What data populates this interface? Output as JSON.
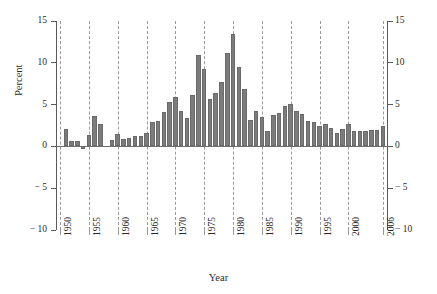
{
  "chart_data": {
    "type": "bar",
    "title": "",
    "subtitle": "",
    "xlabel": "Year",
    "ylabel": "Percent",
    "xlim": [
      1949.3,
      2006.7
    ],
    "ylim": [
      -10,
      15
    ],
    "yticks": [
      15,
      10,
      5,
      0,
      -5,
      -10
    ],
    "ytick_labels": [
      "15",
      "10",
      "5",
      "0",
      "− 5",
      "− 10"
    ],
    "xticks": [
      1950,
      1955,
      1960,
      1965,
      1970,
      1975,
      1980,
      1985,
      1990,
      1995,
      2000,
      2006
    ],
    "xtick_labels": [
      "1950",
      "1955",
      "1960",
      "1965",
      "1970",
      "1975",
      "1980",
      "1985",
      "1990",
      "1995",
      "2000",
      "2006"
    ],
    "grid": "vertical-dashed-at-xticks",
    "legend": "none",
    "bar_color": "#7c7c7c",
    "bar_edge_color": "#6a6a6a",
    "axis_color": "#5a5a5a",
    "grid_color": "#9a9a9a",
    "right_axis_mirrors_left": true,
    "categories": [
      1950,
      1951,
      1952,
      1953,
      1954,
      1955,
      1956,
      1957,
      1958,
      1959,
      1960,
      1961,
      1962,
      1963,
      1964,
      1965,
      1966,
      1967,
      1968,
      1969,
      1970,
      1971,
      1972,
      1973,
      1974,
      1975,
      1976,
      1977,
      1978,
      1979,
      1980,
      1981,
      1982,
      1983,
      1984,
      1985,
      1986,
      1987,
      1988,
      1989,
      1990,
      1991,
      1992,
      1993,
      1994,
      1995,
      1996,
      1997,
      1998,
      1999,
      2000,
      2001,
      2002,
      2003,
      2004,
      2005,
      2006
    ],
    "values": [
      0.0,
      2.1,
      0.7,
      0.6,
      -0.3,
      1.4,
      3.6,
      2.7,
      0.0,
      0.8,
      1.5,
      0.9,
      1.0,
      1.2,
      1.3,
      1.6,
      2.9,
      3.0,
      4.1,
      5.3,
      5.9,
      4.2,
      3.4,
      6.2,
      10.9,
      9.2,
      5.7,
      6.4,
      7.7,
      11.2,
      13.5,
      9.5,
      6.9,
      3.2,
      4.2,
      3.5,
      1.9,
      3.8,
      4.0,
      4.8,
      5.1,
      4.2,
      3.9,
      3.0,
      2.9,
      2.5,
      2.7,
      2.2,
      1.6,
      2.1,
      2.7,
      1.9,
      1.9,
      1.9,
      2.0,
      2.0,
      2.5
    ],
    "series_name": "Inflation rate"
  },
  "axes": {
    "ylabel_text": "Percent",
    "xlabel_text": "Year"
  }
}
